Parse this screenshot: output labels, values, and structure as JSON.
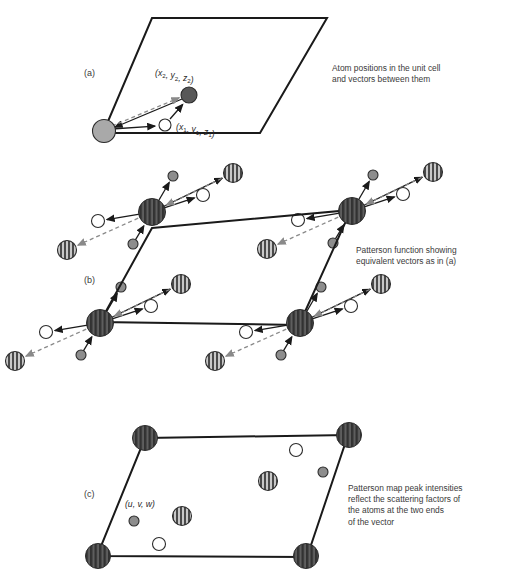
{
  "figure": {
    "background": "#ffffff",
    "width": 505,
    "height": 581
  },
  "style": {
    "line_color": "#1a1a1a",
    "cell_stroke_width": 2.0,
    "vector_solid_color": "#1a1a1a",
    "vector_dashed_color": "#8a8a8a",
    "vector_width": 1.3,
    "text_color": "#3a3a3a",
    "atom_light_gray": "#a9a9a9",
    "atom_dark_gray": "#585858",
    "atom_white": "#ffffff",
    "atom_outline": "#2b2b2b",
    "peak_stripe_dark": "#4a4a4a",
    "peak_stripe_light": "#c8c8c8",
    "corner_peak_dark": "#3a3a3a",
    "corner_peak_light": "#5e5e5e",
    "small_gray": "#8d8d8d"
  },
  "panels": [
    {
      "id": "a",
      "label": "(a)",
      "label_pos": [
        84,
        76
      ],
      "caption": [
        "Atom positions in the unit cell",
        "and vectors between them"
      ],
      "caption_pos": [
        332,
        71
      ],
      "cell": {
        "points": "152,18 327,18 260,133 103,133",
        "description": "unit cell parallelogram"
      },
      "atoms": [
        {
          "name": "origin-atom",
          "type": "light-gray",
          "cx": 104,
          "cy": 131,
          "r": 11.5
        },
        {
          "name": "atom-1-white",
          "type": "white",
          "cx": 165,
          "cy": 125,
          "r": 6.0
        },
        {
          "name": "atom-2-dark",
          "type": "dark-gray",
          "cx": 189,
          "cy": 95,
          "r": 8.0
        }
      ],
      "coord_labels": [
        {
          "name": "coord-x2y2z2",
          "base": "x",
          "sub1": "2",
          "v2": "y",
          "sub2": "2",
          "v3": "z",
          "sub3": "2",
          "x": 155,
          "y": 76
        },
        {
          "name": "coord-x1y1z1",
          "base": "x",
          "sub1": "1",
          "v2": "y",
          "sub2": "1",
          "v3": "z",
          "sub3": "1",
          "x": 176,
          "y": 130
        }
      ],
      "vectors": [
        {
          "name": "vector-origin-to-white",
          "style": "solid",
          "x1": 112,
          "y1": 129,
          "x2": 157,
          "y2": 126
        },
        {
          "name": "vector-white-to-dark",
          "style": "solid",
          "x1": 170,
          "y1": 119,
          "x2": 184,
          "y2": 103
        },
        {
          "name": "vector-dark-to-origin",
          "style": "solid",
          "x1": 182,
          "y1": 99,
          "x2": 113,
          "y2": 128
        },
        {
          "name": "vector-origin-to-dark-dashed",
          "style": "dashed",
          "x1": 112,
          "y1": 126,
          "x2": 181,
          "y2": 97
        }
      ]
    },
    {
      "id": "b",
      "label": "(b)",
      "label_pos": [
        84,
        283
      ],
      "caption": [
        "Patterson function showing",
        "equivalent vectors as in (a)"
      ],
      "caption_pos": [
        356,
        253
      ],
      "cell": {
        "points": "152,228 351,210 299,325 100,322",
        "description": "Patterson cell parallelogram"
      },
      "corners": [
        {
          "name": "patterson-corner-top-left",
          "cx": 152,
          "cy": 212,
          "r": 13.5
        },
        {
          "name": "patterson-corner-top-right",
          "cx": 352,
          "cy": 211,
          "r": 13.5
        },
        {
          "name": "patterson-corner-bottom-left",
          "cx": 100,
          "cy": 323,
          "r": 13.5
        },
        {
          "name": "patterson-corner-bottom-right",
          "cx": 300,
          "cy": 323,
          "r": 13.5
        }
      ],
      "cluster": {
        "description": "repeated satellite pattern around every corner peak",
        "satellites": [
          {
            "name": "satellite-small-gray-upper",
            "type": "small-gray",
            "dx": 21,
            "dy": -36,
            "r": 5.0
          },
          {
            "name": "satellite-white-right",
            "type": "white",
            "dx": 51,
            "dy": -17,
            "r": 6.5
          },
          {
            "name": "satellite-striped-upper-right",
            "type": "striped",
            "dx": 81,
            "dy": -39,
            "r": 9.5
          },
          {
            "name": "satellite-white-left",
            "type": "white",
            "dx": -54,
            "dy": 9,
            "r": 6.5
          },
          {
            "name": "satellite-small-gray-lower",
            "type": "small-gray",
            "dx": -19,
            "dy": 32,
            "r": 5.0
          },
          {
            "name": "satellite-striped-lower-left",
            "type": "striped",
            "dx": -85,
            "dy": 38,
            "r": 9.5
          }
        ],
        "vectors": [
          {
            "name": "cluster-vector-to-small-upper",
            "style": "solid",
            "from": "center",
            "to": 0
          },
          {
            "name": "cluster-vector-to-white-right",
            "style": "solid",
            "from": "center",
            "to": 1
          },
          {
            "name": "cluster-vector-to-striped-upper",
            "style": "solid",
            "from": "center",
            "to": 2
          },
          {
            "name": "cluster-vector-to-white-left",
            "style": "solid",
            "from": "center",
            "to": 3
          },
          {
            "name": "cluster-vector-from-small-lower",
            "style": "solid",
            "from": 4,
            "to": "center"
          },
          {
            "name": "cluster-vector-to-striped-lower-dashed",
            "style": "dashed",
            "from": "center",
            "to": 5
          },
          {
            "name": "cluster-vector-from-striped-upper-dashed",
            "style": "dashed",
            "from": 2,
            "to": "center"
          }
        ]
      }
    },
    {
      "id": "c",
      "label": "(c)",
      "label_pos": [
        84,
        497
      ],
      "caption": [
        "Patterson map peak intensities",
        "reflect the scattering factors of",
        "the atoms at the two ends",
        "of the vector"
      ],
      "caption_pos": [
        348,
        491
      ],
      "cell": {
        "points": "145,438 348,435 307,557 97,556",
        "description": "Patterson map parallelogram"
      },
      "corners": [
        {
          "name": "map-corner-top-left",
          "cx": 145,
          "cy": 438,
          "r": 12.5
        },
        {
          "name": "map-corner-top-right",
          "cx": 349,
          "cy": 435,
          "r": 12.5
        },
        {
          "name": "map-corner-bottom-left",
          "cx": 98,
          "cy": 556,
          "r": 12.5
        },
        {
          "name": "map-corner-bottom-right",
          "cx": 306,
          "cy": 556,
          "r": 12.5
        }
      ],
      "peaks": [
        {
          "name": "peak-white-upper",
          "type": "white",
          "cx": 296,
          "cy": 450,
          "r": 6.5
        },
        {
          "name": "peak-small-gray-upper",
          "type": "small-gray",
          "cx": 323,
          "cy": 472,
          "r": 5.0
        },
        {
          "name": "peak-striped-upper",
          "type": "striped",
          "cx": 268,
          "cy": 481,
          "r": 9.5
        },
        {
          "name": "peak-striped-lower",
          "type": "striped",
          "cx": 182,
          "cy": 516,
          "r": 9.5
        },
        {
          "name": "peak-small-gray-lower",
          "type": "small-gray",
          "cx": 134,
          "cy": 521,
          "r": 5.0
        },
        {
          "name": "peak-white-lower",
          "type": "white",
          "cx": 159,
          "cy": 544,
          "r": 6.5
        }
      ],
      "coord_label": {
        "name": "coord-uvw",
        "text": "(u, v, w)",
        "x": 125,
        "y": 507
      }
    }
  ]
}
